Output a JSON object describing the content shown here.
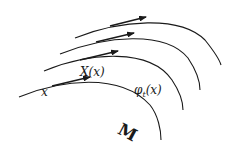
{
  "diagram": {
    "type": "flow-lines-on-manifold",
    "labels": {
      "point": "x",
      "vector_field": "X(x)",
      "flow_symbol": "φ",
      "flow_subscript": "t",
      "flow_arg": "(x)",
      "manifold": "M"
    },
    "curves": [
      {
        "name": "base-curve",
        "path": "M19,97 C60,80 120,72 150,105 C158,115 161,130 161,140",
        "arrow": [
          52,
          86,
          90,
          77
        ]
      },
      {
        "name": "flow-curve-2",
        "path": "M44,71 C90,52 150,48 172,80 C180,92 183,100 183,110",
        "arrow": [
          80,
          60,
          118,
          51
        ]
      },
      {
        "name": "flow-curve-3",
        "path": "M60,54 C105,36 165,30 188,58 C196,70 200,80 200,90",
        "arrow": [
          96,
          42,
          134,
          33
        ]
      },
      {
        "name": "flow-curve-4",
        "path": "M75,38 C120,20 180,15 205,40 C213,50 219,58 221,65",
        "arrow": [
          110,
          26,
          146,
          17
        ]
      }
    ],
    "colors": {
      "stroke": "#1a1a1a",
      "background": "#ffffff"
    }
  }
}
